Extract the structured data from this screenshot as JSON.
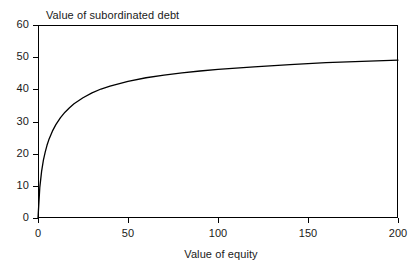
{
  "chart_data": {
    "type": "line",
    "title": "Value of subordinated debt",
    "subtitle": "",
    "xlabel": "Value of equity",
    "ylabel": "",
    "xlim": [
      0,
      200
    ],
    "ylim": [
      0,
      60
    ],
    "xticks": [
      0,
      50,
      100,
      150,
      200
    ],
    "yticks": [
      0,
      10,
      20,
      30,
      40,
      50,
      60
    ],
    "grid": false,
    "legend": null,
    "legend_position": "none",
    "annotations": [],
    "series": [
      {
        "name": "Value of subordinated debt",
        "color": "#000000",
        "x": [
          0,
          1,
          2,
          3,
          4,
          5,
          6,
          8,
          10,
          12.5,
          15,
          17.5,
          20,
          25,
          30,
          35,
          40,
          50,
          60,
          70,
          80,
          90,
          100,
          120,
          140,
          160,
          180,
          200
        ],
        "values": [
          0,
          9.5,
          14.5,
          18.0,
          20.5,
          22.6,
          24.3,
          27.0,
          29.1,
          31.2,
          32.9,
          34.3,
          35.5,
          37.4,
          38.9,
          40.1,
          41.0,
          42.5,
          43.6,
          44.4,
          45.1,
          45.7,
          46.2,
          47.0,
          47.7,
          48.3,
          48.7,
          49.1
        ]
      }
    ],
    "colors": {
      "curve": "#000000",
      "axis": "#000000",
      "background": "#ffffff",
      "text": "#1a1a1a"
    }
  },
  "ticks": {
    "y": [
      {
        "label": "60",
        "value": 60
      },
      {
        "label": "50",
        "value": 50
      },
      {
        "label": "40",
        "value": 40
      },
      {
        "label": "30",
        "value": 30
      },
      {
        "label": "20",
        "value": 20
      },
      {
        "label": "10",
        "value": 10
      },
      {
        "label": "0",
        "value": 0
      }
    ],
    "x": [
      {
        "label": "0",
        "value": 0
      },
      {
        "label": "50",
        "value": 50
      },
      {
        "label": "100",
        "value": 100
      },
      {
        "label": "150",
        "value": 150
      },
      {
        "label": "200",
        "value": 200
      }
    ]
  }
}
